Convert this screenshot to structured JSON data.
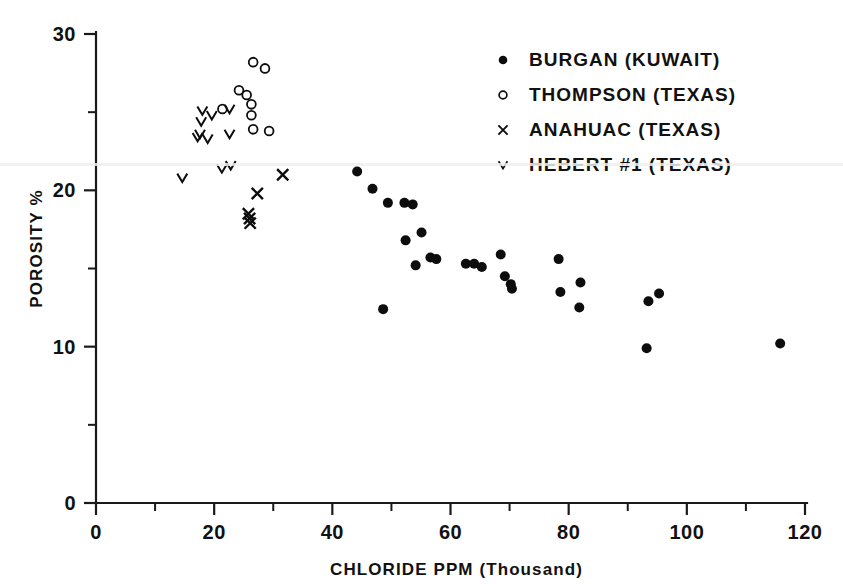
{
  "chart_data": {
    "type": "scatter",
    "title": "",
    "xlabel": "CHLORIDE PPM (Thousand)",
    "ylabel": "POROSITY %",
    "xlim": [
      0,
      120
    ],
    "ylim": [
      0,
      30
    ],
    "xticks": [
      0,
      20,
      40,
      60,
      80,
      100,
      120
    ],
    "yticks": [
      0,
      10,
      20,
      30
    ],
    "x_minor_ticks": [
      10,
      30,
      50,
      70,
      90,
      110
    ],
    "y_minor_ticks": [
      5,
      15,
      25
    ],
    "grid": false,
    "legend_position": "upper right",
    "series": [
      {
        "name": "BURGAN (KUWAIT)",
        "marker": "filled-dot",
        "points": [
          [
            44.2,
            21.2
          ],
          [
            46.8,
            20.1
          ],
          [
            48.6,
            12.4
          ],
          [
            49.4,
            19.2
          ],
          [
            52.2,
            19.2
          ],
          [
            53.6,
            19.1
          ],
          [
            52.4,
            16.8
          ],
          [
            55.1,
            17.3
          ],
          [
            54.1,
            15.2
          ],
          [
            56.6,
            15.7
          ],
          [
            57.6,
            15.6
          ],
          [
            62.6,
            15.3
          ],
          [
            64.0,
            15.3
          ],
          [
            65.3,
            15.1
          ],
          [
            68.5,
            15.9
          ],
          [
            69.2,
            14.5
          ],
          [
            70.2,
            14.0
          ],
          [
            70.4,
            13.7
          ],
          [
            78.3,
            15.6
          ],
          [
            78.6,
            13.5
          ],
          [
            82.0,
            14.1
          ],
          [
            81.8,
            12.5
          ],
          [
            93.2,
            9.9
          ],
          [
            93.5,
            12.9
          ],
          [
            95.3,
            13.4
          ],
          [
            115.8,
            10.2
          ]
        ]
      },
      {
        "name": "THOMPSON (TEXAS)",
        "marker": "open-circle",
        "points": [
          [
            26.6,
            28.2
          ],
          [
            28.6,
            27.8
          ],
          [
            24.2,
            26.4
          ],
          [
            25.5,
            26.1
          ],
          [
            26.3,
            25.5
          ],
          [
            26.3,
            24.8
          ],
          [
            26.6,
            23.9
          ],
          [
            29.3,
            23.8
          ],
          [
            21.4,
            25.2
          ]
        ]
      },
      {
        "name": "ANAHUAC (TEXAS)",
        "marker": "cross-x",
        "points": [
          [
            31.6,
            21.0
          ],
          [
            27.3,
            19.8
          ],
          [
            25.8,
            18.5
          ],
          [
            26.0,
            18.2
          ],
          [
            26.1,
            17.9
          ]
        ]
      },
      {
        "name": "HEBERT #1 (TEXAS)",
        "marker": "vee",
        "points": [
          [
            18.0,
            25.1
          ],
          [
            17.8,
            24.4
          ],
          [
            19.6,
            24.8
          ],
          [
            17.6,
            23.6
          ],
          [
            17.2,
            23.4
          ],
          [
            18.9,
            23.3
          ],
          [
            22.6,
            25.2
          ],
          [
            22.6,
            23.6
          ],
          [
            22.8,
            21.6
          ],
          [
            21.3,
            21.4
          ],
          [
            14.6,
            20.8
          ]
        ]
      }
    ]
  },
  "axes": {
    "x_tick_labels": [
      "0",
      "20",
      "40",
      "60",
      "80",
      "100",
      "120"
    ],
    "y_tick_labels": [
      "0",
      "10",
      "20",
      "30"
    ],
    "x_axis_title": "CHLORIDE PPM (Thousand)",
    "y_axis_title": "POROSITY %"
  },
  "legend": {
    "items": [
      {
        "marker": "filled-dot-icon",
        "label": "BURGAN (KUWAIT)"
      },
      {
        "marker": "open-circle-icon",
        "label": "THOMPSON (TEXAS)"
      },
      {
        "marker": "cross-x-icon",
        "label": "ANAHUAC (TEXAS)"
      },
      {
        "marker": "vee-icon",
        "label": "HEBERT #1 (TEXAS)"
      }
    ]
  },
  "colors": {
    "ink": "#0d0d0d",
    "background": "#ffffff"
  }
}
